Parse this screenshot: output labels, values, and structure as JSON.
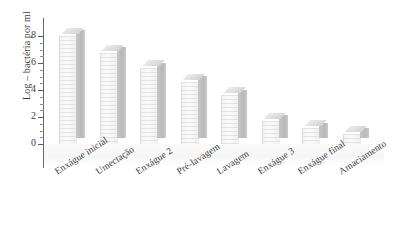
{
  "chart_data": {
    "type": "bar",
    "title": "",
    "subtitle": "",
    "xlabel": "",
    "ylabel": "Log – bactéria por ml",
    "ylim": [
      0,
      8
    ],
    "ytick_labels": [
      "0",
      "2",
      "4",
      "6",
      "8"
    ],
    "ytick_values": [
      0,
      2,
      4,
      6,
      8
    ],
    "minor_tick_step": 0.5,
    "grid": false,
    "legend": null,
    "style": "3d-bar",
    "categories": [
      "Enxágue inicial",
      "Umectação",
      "Enxágue 2",
      "Pré-lavagem",
      "Lavagem",
      "Enxágue 3",
      "Enxágue final",
      "Amaciamento"
    ],
    "values": [
      8.0,
      6.75,
      5.6,
      4.6,
      3.6,
      1.7,
      1.15,
      0.75
    ],
    "series": [
      {
        "name": "Log – bactéria por ml",
        "values": [
          8.0,
          6.75,
          5.6,
          4.6,
          3.6,
          1.7,
          1.15,
          0.75
        ]
      }
    ],
    "colors": {
      "bar_front": "#f4f4f4",
      "bar_side": "#bfbfbf",
      "bar_top": "#e2e2e2",
      "axis": "#6a6a6a",
      "text": "#3c3c3c",
      "background": "#ffffff"
    }
  },
  "axis": {
    "y_title": "Log – bactéria por ml",
    "ticks": [
      {
        "label": "8",
        "value": 8
      },
      {
        "label": "6",
        "value": 6
      },
      {
        "label": "4",
        "value": 4
      },
      {
        "label": "2",
        "value": 2
      },
      {
        "label": "0",
        "value": 0
      }
    ]
  }
}
